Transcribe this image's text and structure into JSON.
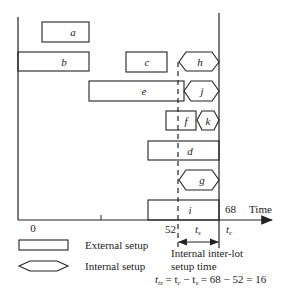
{
  "diagram": {
    "axis": {
      "origin_label": "0",
      "x_label": "Time",
      "start_label": "52",
      "end_label": "68",
      "tc_label": "t",
      "tc_sub": "c",
      "ts_label": "t",
      "ts_sub": "s"
    },
    "tasks": [
      {
        "id": "a",
        "type": "external"
      },
      {
        "id": "b",
        "type": "external"
      },
      {
        "id": "c",
        "type": "external"
      },
      {
        "id": "h",
        "type": "internal"
      },
      {
        "id": "e",
        "type": "external"
      },
      {
        "id": "j",
        "type": "internal"
      },
      {
        "id": "f",
        "type": "external"
      },
      {
        "id": "k",
        "type": "internal"
      },
      {
        "id": "d",
        "type": "external"
      },
      {
        "id": "g",
        "type": "internal"
      },
      {
        "id": "i",
        "type": "external"
      }
    ],
    "legend": {
      "external": "External setup",
      "internal": "Internal setup"
    },
    "annotation": {
      "line1": "Internal inter-lot",
      "line2": "setup time",
      "formula": "t",
      "formula_sub": "is",
      "formula_rest": " = t",
      "formula_sub2": "c",
      "formula_rest2": " − t",
      "formula_sub3": "s",
      "formula_rest3": " = 68 − 52 = 16"
    }
  }
}
